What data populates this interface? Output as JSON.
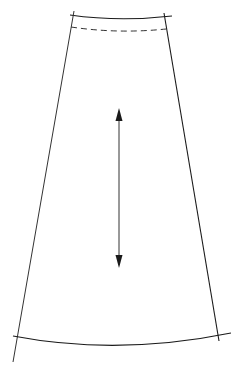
{
  "diagram": {
    "type": "sewing-pattern-piece",
    "colors": {
      "background": "#ffffff",
      "line": "#1a1a1a",
      "light_line": "#555555"
    },
    "waist_seam": {
      "left": [
        70,
        15
      ],
      "mid": [
        119,
        19
      ],
      "right": [
        172,
        16
      ]
    },
    "waistband_fold_dashed": {
      "left": [
        71,
        27
      ],
      "mid": [
        118,
        31
      ],
      "right": [
        166,
        29
      ]
    },
    "left_side_seam": {
      "top": [
        74,
        11
      ],
      "bottom": [
        13,
        362
      ]
    },
    "right_side_seam": {
      "top": [
        164,
        13
      ],
      "bottom": [
        219,
        341
      ]
    },
    "hem": {
      "left": [
        13,
        336
      ],
      "mid": [
        118,
        347
      ],
      "right": [
        231,
        333
      ]
    },
    "grain_line": {
      "top": [
        119,
        110
      ],
      "bottom": [
        119,
        267
      ]
    }
  }
}
